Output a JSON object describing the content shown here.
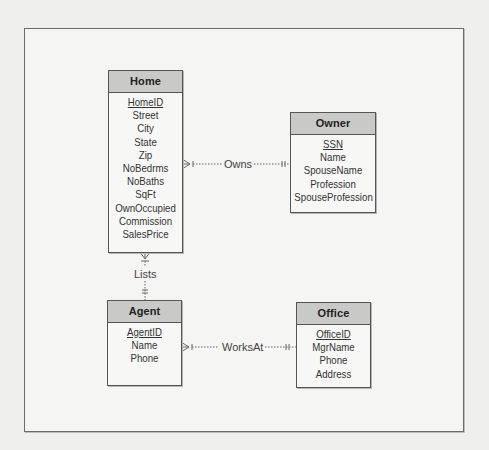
{
  "diagram": {
    "type": "entity-relationship",
    "notation": "crow's foot",
    "entities": [
      {
        "name": "Home",
        "primary_key": "HomeID",
        "attributes": [
          "HomeID",
          "Street",
          "City",
          "State",
          "Zip",
          "NoBedrms",
          "NoBaths",
          "SqFt",
          "OwnOccupied",
          "Commission",
          "SalesPrice"
        ]
      },
      {
        "name": "Owner",
        "primary_key": "SSN",
        "attributes": [
          "SSN",
          "Name",
          "SpouseName",
          "Profession",
          "SpouseProfession"
        ]
      },
      {
        "name": "Agent",
        "primary_key": "AgentID",
        "attributes": [
          "AgentID",
          "Name",
          "Phone"
        ]
      },
      {
        "name": "Office",
        "primary_key": "OfficeID",
        "attributes": [
          "OfficeID",
          "MgrName",
          "Phone",
          "Address"
        ]
      }
    ],
    "relationships": [
      {
        "label": "Owns",
        "from": "Home",
        "from_cardinality": "one-or-many",
        "to": "Owner",
        "to_cardinality": "one-and-only-one"
      },
      {
        "label": "Lists",
        "from": "Home",
        "from_cardinality": "zero-or-many",
        "to": "Agent",
        "to_cardinality": "one-and-only-one"
      },
      {
        "label": "WorksAt",
        "from": "Agent",
        "from_cardinality": "one-or-many",
        "to": "Office",
        "to_cardinality": "one-and-only-one"
      }
    ]
  },
  "colors": {
    "header_fill": "#c9c9c7",
    "box_border": "#555555",
    "line": "#777777"
  }
}
